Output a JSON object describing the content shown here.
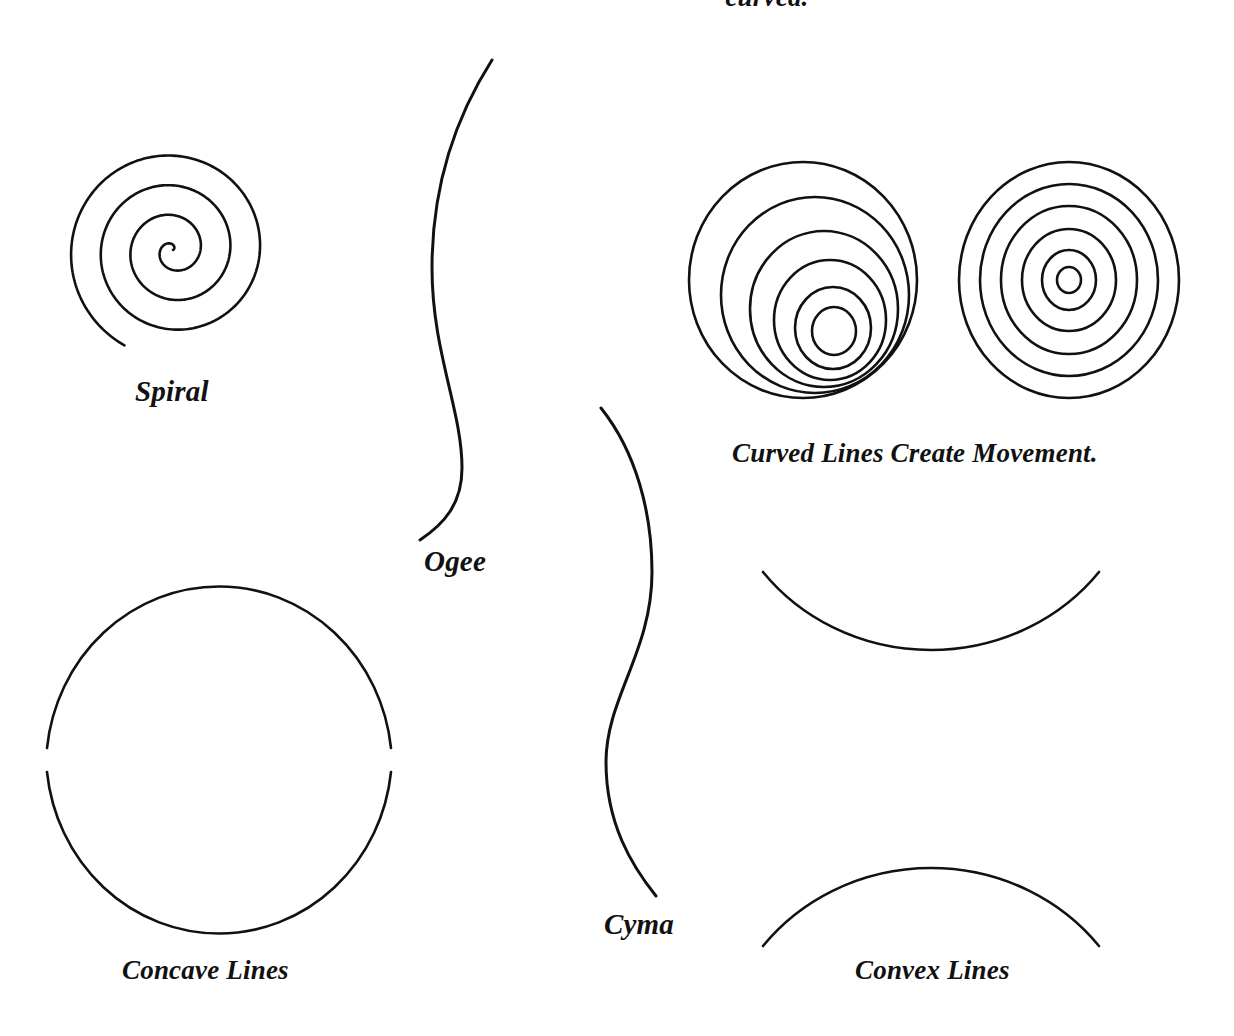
{
  "page": {
    "title": "Curved Lines",
    "background_color": "#ffffff",
    "ink_color": "#111111",
    "width": 1234,
    "height": 1036
  },
  "headings": {
    "top_clipped": "curved."
  },
  "figures": [
    {
      "id": "spiral",
      "name": "spiral-figure",
      "caption": "Spiral",
      "shape_type": "archimedean-spiral",
      "center": [
        173,
        250
      ],
      "outer_radius": 107,
      "turns": 3.6
    },
    {
      "id": "ogee",
      "name": "ogee-figure",
      "caption": "Ogee",
      "shape_type": "s-curve",
      "start": [
        492,
        60
      ],
      "end": [
        420,
        540
      ]
    },
    {
      "id": "cyma",
      "name": "cyma-figure",
      "caption": "Cyma",
      "shape_type": "reverse-s-curve",
      "start": [
        601,
        408
      ],
      "end": [
        656,
        896
      ]
    },
    {
      "id": "eccentric-circles",
      "name": "eccentric-circles-figure",
      "shape_type": "eccentric-circles",
      "rings": 6,
      "outer_center": [
        803,
        280
      ],
      "outer_radius": 114
    },
    {
      "id": "concentric-circles",
      "name": "concentric-circles-figure",
      "shape_type": "concentric-circles",
      "rings": 6,
      "center": [
        1069,
        280
      ],
      "outer_radius": 110
    },
    {
      "id": "concave",
      "name": "concave-lines-figure",
      "caption": "Concave Lines",
      "shape_type": "split-circle-arcs",
      "center": [
        218,
        755
      ],
      "radius": 173
    },
    {
      "id": "convex",
      "name": "convex-lines-figure",
      "caption": "Convex Lines",
      "shape_type": "opposing-arcs",
      "upper_arc_center": [
        930,
        400
      ],
      "lower_arc_center": [
        930,
        1120
      ],
      "radius": 348
    }
  ],
  "captions": {
    "spiral": "Spiral",
    "ogee": "Ogee",
    "cyma": "Cyma",
    "movement": "Curved Lines Create Movement.",
    "concave": "Concave Lines",
    "convex": "Convex Lines"
  }
}
